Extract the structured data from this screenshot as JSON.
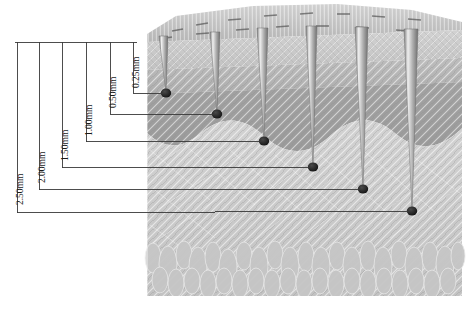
{
  "figure": {
    "unit": "mm"
  },
  "dimensions": [
    {
      "id": "d-2-50",
      "label": "2.50mm",
      "value": 2.5,
      "rule_x": 17,
      "label_x": 15,
      "label_y": 205,
      "leader_y": 213,
      "tip_x": 412,
      "tip_y": 211
    },
    {
      "id": "d-2-00",
      "label": "2.00mm",
      "value": 2.0,
      "rule_x": 39,
      "label_x": 37,
      "label_y": 183,
      "leader_y": 190,
      "tip_x": 363,
      "tip_y": 189
    },
    {
      "id": "d-1-50",
      "label": "1.50mm",
      "value": 1.5,
      "rule_x": 62,
      "label_x": 60,
      "label_y": 161,
      "leader_y": 168,
      "tip_x": 313,
      "tip_y": 167
    },
    {
      "id": "d-1-00",
      "label": "1.00mm",
      "value": 1.0,
      "rule_x": 86,
      "label_x": 84,
      "label_y": 136,
      "leader_y": 142,
      "tip_x": 264,
      "tip_y": 141
    },
    {
      "id": "d-0-50",
      "label": "0.50mm",
      "value": 0.5,
      "rule_x": 110,
      "label_x": 108,
      "label_y": 108,
      "leader_y": 114,
      "tip_x": 217,
      "tip_y": 114
    },
    {
      "id": "d-0-25",
      "label": "0.25mm",
      "value": 0.25,
      "rule_x": 133,
      "label_x": 131,
      "label_y": 88,
      "leader_y": 93,
      "tip_x": 166,
      "tip_y": 93
    }
  ],
  "datum": {
    "top_rule_y": 42,
    "top_rule_x1": 15,
    "top_rule_x2": 137
  },
  "needles": [
    {
      "id": "needle-1",
      "depth_label": "0.25mm",
      "top_x": 163,
      "tip_x": 166,
      "tip_y": 93
    },
    {
      "id": "needle-2",
      "depth_label": "0.50mm",
      "top_x": 215,
      "tip_x": 217,
      "tip_y": 114
    },
    {
      "id": "needle-3",
      "depth_label": "1.00mm",
      "top_x": 262,
      "tip_x": 264,
      "tip_y": 141
    },
    {
      "id": "needle-4",
      "depth_label": "1.50mm",
      "top_x": 311,
      "tip_x": 313,
      "tip_y": 167
    },
    {
      "id": "needle-5",
      "depth_label": "2.00mm",
      "top_x": 361,
      "tip_x": 363,
      "tip_y": 189
    },
    {
      "id": "needle-6",
      "depth_label": "2.50mm",
      "top_x": 410,
      "tip_x": 412,
      "tip_y": 211
    }
  ],
  "skin_layers": [
    {
      "name": "epidermis",
      "color": "#c9c9c9"
    },
    {
      "name": "upper-dermis",
      "color": "#b4b4b4"
    },
    {
      "name": "lower-dermis",
      "color": "#9d9d9d"
    },
    {
      "name": "hypodermis",
      "color": "#cacaca"
    },
    {
      "name": "subcutaneous-fat",
      "color": "#c4c4c4"
    }
  ],
  "colors": {
    "line": "#333333",
    "tip": "#1b1b1b",
    "needle": "#a8a8a8",
    "background": "#ffffff"
  }
}
